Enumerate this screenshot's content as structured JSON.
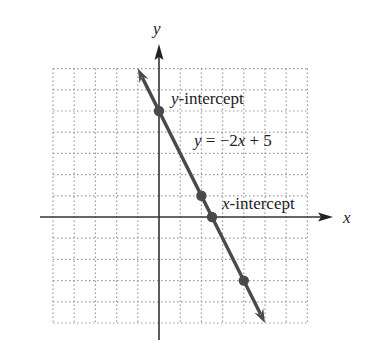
{
  "chart_data": {
    "type": "line",
    "title": "",
    "equation": "y = −2x + 5",
    "xlabel": "x",
    "ylabel": "y",
    "xlim": [
      -5,
      7
    ],
    "ylim": [
      -5,
      7
    ],
    "grid": true,
    "grid_style": "dotted",
    "series": [
      {
        "name": "y = -2x + 5",
        "slope": -2,
        "intercept": 5,
        "line_from": [
          -1,
          7
        ],
        "line_to": [
          5,
          -5
        ],
        "points": [
          {
            "x": 0,
            "y": 5
          },
          {
            "x": 2,
            "y": 1
          },
          {
            "x": 2.5,
            "y": 0
          },
          {
            "x": 4,
            "y": -3
          }
        ]
      }
    ],
    "annotations": [
      {
        "text": "y-intercept",
        "at": [
          0,
          5
        ]
      },
      {
        "text": "x-intercept",
        "at": [
          2.5,
          0
        ]
      },
      {
        "text": "y = −2x + 5",
        "at": [
          1,
          3
        ]
      }
    ]
  },
  "labels": {
    "x_axis": "x",
    "y_axis": "y",
    "y_intercept_var": "y",
    "y_intercept_rest": "-intercept",
    "x_intercept_var": "x",
    "x_intercept_rest": "-intercept",
    "eq_y": "y",
    "eq_mid": " = −2",
    "eq_x": "x",
    "eq_end": " + 5"
  },
  "colors": {
    "line": "#4a4a4a",
    "axis": "#333333",
    "grid": "#9a9a9a"
  }
}
